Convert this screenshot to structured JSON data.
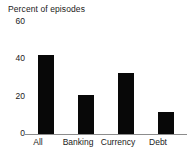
{
  "chart_data": {
    "type": "bar",
    "title": "Percent of episodes",
    "xlabel": "",
    "ylabel": "Percent of episodes",
    "categories": [
      "All",
      "Banking",
      "Currency",
      "Debt"
    ],
    "values": [
      40,
      20,
      31,
      11
    ],
    "yticks": [
      0,
      20,
      40,
      60
    ],
    "ytick_labels": [
      "0",
      "20",
      "40",
      "60"
    ],
    "ylim": [
      0,
      60
    ],
    "grid": false,
    "legend": false,
    "bar_color": "#080808",
    "axis_color": "#8c8c8c",
    "text_color": "#1a1a1a",
    "background_color": "#ffffff"
  },
  "ticks": {
    "t60": "60",
    "t40": "40",
    "t20": "20",
    "t0": "0"
  },
  "labels": {
    "all": "All",
    "banking": "Banking",
    "currency": "Currency",
    "debt": "Debt"
  },
  "title": "Percent of episodes"
}
